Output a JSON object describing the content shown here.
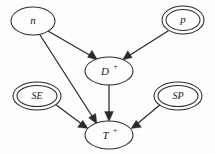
{
  "diagram": {
    "type": "dag",
    "background_color": "#fdfdfd",
    "stroke_color": "#2b2b2b",
    "nodes": [
      {
        "id": "n",
        "label": "n",
        "superscript": "",
        "shape": "ellipse",
        "double_border": false,
        "cx": 33,
        "cy": 21,
        "rx": 22,
        "ry": 14
      },
      {
        "id": "p",
        "label": "p",
        "superscript": "",
        "shape": "ellipse",
        "double_border": true,
        "cx": 183,
        "cy": 20,
        "rx": 21,
        "ry": 14
      },
      {
        "id": "D",
        "label": "D",
        "superscript": "+",
        "shape": "ellipse",
        "double_border": false,
        "cx": 109,
        "cy": 71,
        "rx": 24,
        "ry": 14
      },
      {
        "id": "SE",
        "label": "SE",
        "superscript": "",
        "shape": "ellipse",
        "double_border": true,
        "cx": 37,
        "cy": 96,
        "rx": 24,
        "ry": 14
      },
      {
        "id": "SP",
        "label": "SP",
        "superscript": "",
        "shape": "ellipse",
        "double_border": true,
        "cx": 178,
        "cy": 96,
        "rx": 24,
        "ry": 14
      },
      {
        "id": "T",
        "label": "T",
        "superscript": "+",
        "shape": "ellipse",
        "double_border": false,
        "cx": 109,
        "cy": 135,
        "rx": 24,
        "ry": 14
      }
    ],
    "edges": [
      {
        "id": "n-to-D",
        "from": "n",
        "to": "D",
        "directed": true
      },
      {
        "id": "p-to-D",
        "from": "p",
        "to": "D",
        "directed": true
      },
      {
        "id": "n-to-T",
        "from": "n",
        "to": "T",
        "directed": true
      },
      {
        "id": "D-to-T",
        "from": "D",
        "to": "T",
        "directed": true
      },
      {
        "id": "SE-to-T",
        "from": "SE",
        "to": "T",
        "directed": true
      },
      {
        "id": "SP-to-T",
        "from": "SP",
        "to": "T",
        "directed": true
      }
    ]
  }
}
